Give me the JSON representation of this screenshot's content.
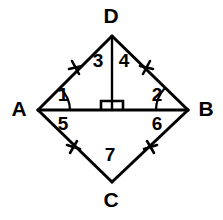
{
  "figure": {
    "type": "geometry-diagram",
    "shape": "kite-quadrilateral-ADBC-with-altitude",
    "background_color": "#ffffff",
    "stroke_color": "#000000",
    "vertices": [
      {
        "name": "D",
        "label": "D",
        "x": 112,
        "y": 36,
        "label_x": 111,
        "label_y": 17
      },
      {
        "name": "A",
        "label": "A",
        "x": 38,
        "y": 110,
        "label_x": 19,
        "label_y": 110
      },
      {
        "name": "B",
        "label": "B",
        "x": 188,
        "y": 110,
        "label_x": 206,
        "label_y": 110
      },
      {
        "name": "C",
        "label": "C",
        "x": 112,
        "y": 182,
        "label_x": 111,
        "label_y": 201
      }
    ],
    "foot": {
      "name": "M",
      "x": 112,
      "y": 110
    },
    "edges": [
      {
        "name": "segment-AD",
        "from": "A",
        "to": "D"
      },
      {
        "name": "segment-DB",
        "from": "D",
        "to": "B"
      },
      {
        "name": "segment-AC",
        "from": "A",
        "to": "C"
      },
      {
        "name": "segment-CB",
        "from": "C",
        "to": "B"
      },
      {
        "name": "segment-AB",
        "from": "A",
        "to": "B"
      },
      {
        "name": "segment-DM",
        "from": "D",
        "to": "M"
      }
    ],
    "angle_labels": [
      {
        "id": "1",
        "label": "1",
        "x": 63,
        "y": 96,
        "at_vertex": "A",
        "region": "above-AB"
      },
      {
        "id": "2",
        "label": "2",
        "x": 157,
        "y": 96,
        "at_vertex": "B",
        "region": "above-AB"
      },
      {
        "id": "3",
        "label": "3",
        "x": 98,
        "y": 62,
        "at_vertex": "D",
        "region": "left-of-altitude"
      },
      {
        "id": "4",
        "label": "4",
        "x": 124,
        "y": 62,
        "at_vertex": "D",
        "region": "right-of-altitude"
      },
      {
        "id": "5",
        "label": "5",
        "x": 63,
        "y": 125,
        "at_vertex": "A",
        "region": "below-AB"
      },
      {
        "id": "6",
        "label": "6",
        "x": 157,
        "y": 125,
        "at_vertex": "B",
        "region": "below-AB"
      },
      {
        "id": "7",
        "label": "7",
        "x": 110,
        "y": 156,
        "at_vertex": "C",
        "region": "above-C"
      }
    ],
    "tick_marks": [
      {
        "name": "tick-AD",
        "on_edge": "segment-AD",
        "x": 75,
        "y": 68,
        "count": 1
      },
      {
        "name": "tick-DB",
        "on_edge": "segment-DB",
        "x": 147,
        "y": 67,
        "count": 1
      },
      {
        "name": "tick-AC",
        "on_edge": "segment-AC",
        "x": 73,
        "y": 147,
        "count": 1
      },
      {
        "name": "tick-CB",
        "on_edge": "segment-CB",
        "x": 150,
        "y": 147,
        "count": 1
      }
    ],
    "arcs": [
      {
        "name": "angle-arc-1",
        "at_vertex": "A",
        "radius": 32
      },
      {
        "name": "angle-arc-2",
        "at_vertex": "B",
        "radius": 32
      }
    ],
    "right_angle": {
      "name": "right-angle-marker",
      "at": "M",
      "x": 100,
      "y": 100,
      "width": 23,
      "height": 10
    }
  }
}
